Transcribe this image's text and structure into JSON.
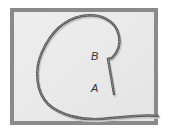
{
  "figure": {
    "colors": {
      "frame": "#8a8a8a",
      "background": "#e9e9e9",
      "rope": "#555555",
      "rope_highlight": "#9a9a9a",
      "label": "#333333"
    },
    "labels": [
      {
        "id": "B",
        "text": "B"
      },
      {
        "id": "A",
        "text": "A"
      }
    ]
  }
}
